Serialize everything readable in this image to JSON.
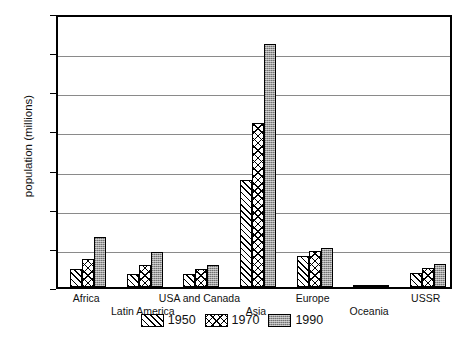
{
  "chart_data": {
    "type": "bar",
    "title": "",
    "xlabel": "",
    "ylabel": "population (millions)",
    "ylim": [
      0,
      3500
    ],
    "yticks": [
      0,
      500,
      1000,
      1500,
      2000,
      2500,
      3000,
      3500
    ],
    "ytick_labels": [
      "0",
      "500",
      "1000",
      "1500",
      "2000",
      "2500",
      "3000",
      "3500"
    ],
    "grid": "horizontal",
    "legend_position": "bottom-center",
    "categories": [
      "Africa",
      "Latin America",
      "USA and Canada",
      "Asia",
      "Europe",
      "Oceania",
      "USSR"
    ],
    "series": [
      {
        "name": "1950",
        "pattern": "diagonal-hatch",
        "values": [
          225,
          165,
          165,
          1370,
          395,
          13,
          180
        ]
      },
      {
        "name": "1970",
        "pattern": "crosshatch",
        "values": [
          360,
          285,
          225,
          2100,
          460,
          20,
          240
        ]
      },
      {
        "name": "1990",
        "pattern": "gray-stipple",
        "values": [
          640,
          450,
          275,
          3110,
          500,
          27,
          290
        ]
      }
    ]
  },
  "legend": {
    "items": [
      {
        "label": "1950",
        "swatch": "diagonal-hatch-swatch"
      },
      {
        "label": "1970",
        "swatch": "crosshatch-swatch"
      },
      {
        "label": "1990",
        "swatch": "gray-stipple-swatch"
      }
    ]
  },
  "colors": {
    "axis": "#000000",
    "gridline": "#8a8a8a",
    "bar_1950": "#ffffff",
    "bar_1970": "#ffffff",
    "bar_1990": "#9d9d9d",
    "background": "#ffffff",
    "text": "#111111"
  }
}
